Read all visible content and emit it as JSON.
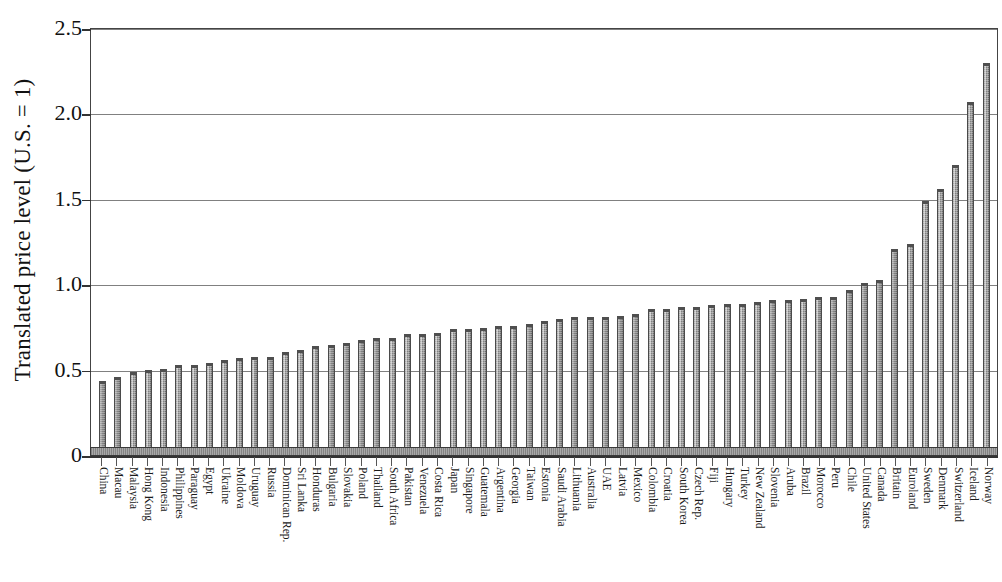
{
  "chart_data": {
    "type": "bar",
    "title": "",
    "xlabel": "",
    "ylabel": "Translated price level (U.S. = 1)",
    "ylim": [
      0,
      2.5
    ],
    "yticks": [
      0,
      0.5,
      1.0,
      1.5,
      2.0,
      2.5
    ],
    "ytick_labels": [
      "0",
      "0.5",
      "1.0",
      "1.5",
      "2.0",
      "2.5"
    ],
    "grid": true,
    "grid_axis": "y",
    "legend": null,
    "bar_color": "#9c9c9c",
    "bar_edge_color": "#4a4a4a",
    "categories": [
      "China",
      "Macau",
      "Malaysia",
      "Hong Kong",
      "Indonesia",
      "Philippines",
      "Paraguay",
      "Egypt",
      "Ukraine",
      "Moldova",
      "Uruguay",
      "Russia",
      "Dominican Rep.",
      "Sri Lanka",
      "Honduras",
      "Bulgaria",
      "Slovakia",
      "Poland",
      "Thailand",
      "South Africa",
      "Pakistan",
      "Venezuela",
      "Costa Rica",
      "Japan",
      "Singapore",
      "Guatemala",
      "Argentina",
      "Georgia",
      "Taiwan",
      "Estonia",
      "Saudi Arabia",
      "Lithuania",
      "Australia",
      "UAE",
      "Latvia",
      "Mexico",
      "Colombia",
      "Croatia",
      "South Korea",
      "Czech Rep.",
      "Fiji",
      "Hungary",
      "Turkey",
      "New Zealand",
      "Slovenia",
      "Aruba",
      "Brazil",
      "Morocco",
      "Peru",
      "Chile",
      "United States",
      "Canada",
      "Britain",
      "Euroland",
      "Sweden",
      "Denmark",
      "Switzerland",
      "Iceland",
      "Norway"
    ],
    "values": [
      0.43,
      0.45,
      0.48,
      0.49,
      0.5,
      0.52,
      0.52,
      0.53,
      0.55,
      0.56,
      0.57,
      0.57,
      0.6,
      0.61,
      0.63,
      0.64,
      0.65,
      0.67,
      0.68,
      0.68,
      0.7,
      0.7,
      0.71,
      0.73,
      0.73,
      0.74,
      0.75,
      0.75,
      0.76,
      0.78,
      0.79,
      0.8,
      0.8,
      0.8,
      0.81,
      0.82,
      0.85,
      0.85,
      0.86,
      0.86,
      0.87,
      0.88,
      0.88,
      0.89,
      0.9,
      0.9,
      0.91,
      0.92,
      0.92,
      0.96,
      1.0,
      1.02,
      1.2,
      1.23,
      1.48,
      1.55,
      1.69,
      2.06,
      2.29
    ]
  },
  "axis": {
    "y_title": "Translated price level (U.S. = 1)"
  }
}
